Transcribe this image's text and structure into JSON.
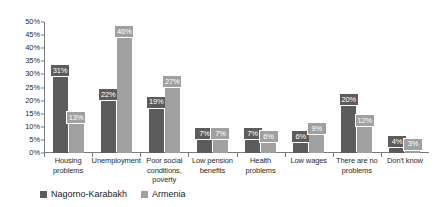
{
  "chart_data": {
    "type": "bar",
    "title": "",
    "subtitle": "",
    "xlabel": "",
    "ylabel": "",
    "ylim": [
      0,
      50
    ],
    "grid": false,
    "legend_position": "bottom-left",
    "y_ticks": [
      "0%",
      "5%",
      "10%",
      "15%",
      "20%",
      "25%",
      "30%",
      "35%",
      "40%",
      "45%",
      "50%"
    ],
    "y_tick_values": [
      0,
      5,
      10,
      15,
      20,
      25,
      30,
      35,
      40,
      45,
      50
    ],
    "categories": [
      "Housing problems",
      "Unemployment",
      "Poor social conditions, poverty",
      "Low pension benefits",
      "Health problems",
      "Low wages",
      "There are no problems",
      "Don't know"
    ],
    "category_lines": [
      [
        "Housing",
        "problems"
      ],
      [
        "Unemployment"
      ],
      [
        "Poor social",
        "conditions,",
        "poverty"
      ],
      [
        "Low pension",
        "benefits"
      ],
      [
        "Health",
        "problems"
      ],
      [
        "Low wages"
      ],
      [
        "There are no",
        "problems"
      ],
      [
        "Don't know"
      ]
    ],
    "series": [
      {
        "name": "Nagorno-Karabakh",
        "color": "#5c5c5c",
        "values": [
          31,
          22,
          19,
          7,
          7,
          6,
          20,
          4
        ],
        "labels": [
          "31%",
          "22%",
          "19%",
          "7%",
          "7%",
          "6%",
          "20%",
          "4%"
        ]
      },
      {
        "name": "Armenia",
        "color": "#a0a0a0",
        "values": [
          13,
          46,
          27,
          7,
          6,
          9,
          12,
          3
        ],
        "labels": [
          "13%",
          "46%",
          "27%",
          "7%",
          "6%",
          "9%",
          "12%",
          "3%"
        ]
      }
    ]
  },
  "legend": {
    "items": [
      {
        "label": "Nagorno-Karabakh",
        "color": "#5c5c5c"
      },
      {
        "label": "Armenia",
        "color": "#a0a0a0"
      }
    ]
  }
}
